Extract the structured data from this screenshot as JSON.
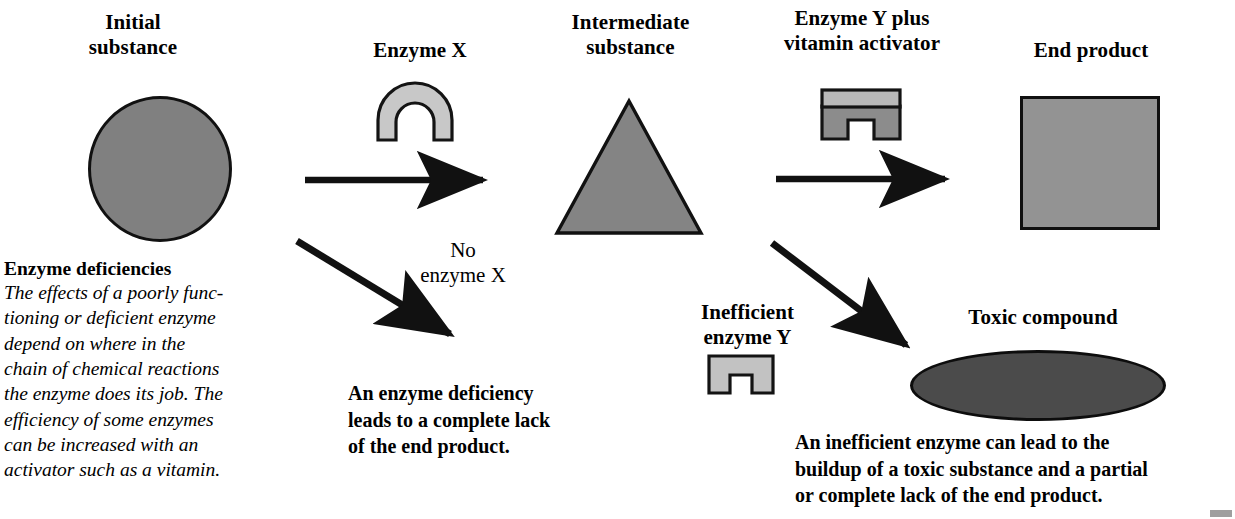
{
  "diagram": {
    "title": "Enzyme deficiencies",
    "colors": {
      "substrate_gray": "#808080",
      "enzyme_light_gray": "#c8c8c8",
      "enzyme_mid_gray": "#8c8c8c",
      "product_gray": "#939393",
      "toxic_dark_gray": "#4b4b4b",
      "outline_black": "#111111",
      "background": "#ffffff"
    }
  },
  "labels": {
    "initial_substance": "Initial\nsubstance",
    "enzyme_x": "Enzyme X",
    "intermediate_substance": "Intermediate\nsubstance",
    "enzyme_y_plus_vitamin": "Enzyme Y plus\nvitamin activator",
    "end_product": "End product",
    "no_enzyme_x": "No\nenzyme X",
    "inefficient_enzyme_y": "Inefficient\nenzyme Y",
    "toxic_compound": "Toxic compound"
  },
  "captions": {
    "sidebar": {
      "heading": "Enzyme deficiencies",
      "body": "The effects of a poorly func-\ntioning or deficient enzyme\ndepend on where in the\nchain of chemical reactions\nthe enzyme does its job. The\nefficiency of some enzymes\ncan be increased with an\nactivator such as a vitamin."
    },
    "deficiency_outcome": "An enzyme deficiency\nleads to a complete lack\nof the end product.",
    "inefficient_outcome": "An inefficient enzyme can lead to the\nbuildup of a toxic substance and a partial\nor complete lack of the end product."
  },
  "shapes": {
    "initial_substance_shape": "circle",
    "enzyme_x_shape": "arch",
    "intermediate_substance_shape": "triangle",
    "enzyme_y_shape": "notched-block",
    "vitamin_activator_shape": "bar",
    "inefficient_enzyme_y_shape": "notched-block-flat",
    "end_product_shape": "square",
    "toxic_compound_shape": "ellipse"
  },
  "arrows": [
    {
      "name": "initial-to-intermediate",
      "direction": "right"
    },
    {
      "name": "intermediate-to-end-product",
      "direction": "right"
    },
    {
      "name": "initial-to-deficiency",
      "direction": "down-right"
    },
    {
      "name": "intermediate-to-toxic",
      "direction": "down-right"
    }
  ]
}
